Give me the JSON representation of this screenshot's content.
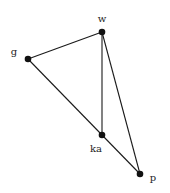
{
  "diagram": {
    "type": "graph",
    "directed": false,
    "nodes": [
      {
        "id": "w",
        "label": "w",
        "x": 102,
        "y": 32,
        "lx": 102,
        "ly": 22,
        "anchor": "middle"
      },
      {
        "id": "g",
        "label": "g",
        "x": 28,
        "y": 59,
        "lx": 14,
        "ly": 55,
        "anchor": "middle"
      },
      {
        "id": "ka",
        "label": "ka",
        "x": 102,
        "y": 135,
        "lx": 96,
        "ly": 152,
        "anchor": "middle"
      },
      {
        "id": "p",
        "label": "p",
        "x": 140,
        "y": 174,
        "lx": 153,
        "ly": 181,
        "anchor": "middle"
      }
    ],
    "edges": [
      {
        "from": "w",
        "to": "g"
      },
      {
        "from": "w",
        "to": "ka"
      },
      {
        "from": "w",
        "to": "p"
      },
      {
        "from": "g",
        "to": "ka"
      },
      {
        "from": "ka",
        "to": "p"
      }
    ],
    "colors": {
      "edge": "#1a1a1a",
      "node": "#111111",
      "label": "#222222",
      "background": "#ffffff"
    }
  }
}
